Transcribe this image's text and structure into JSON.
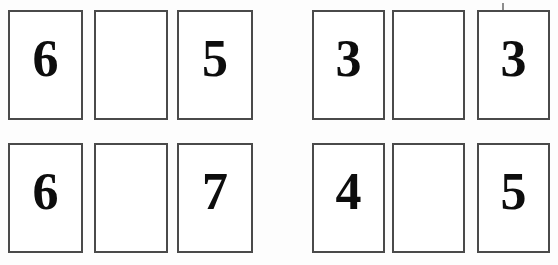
{
  "canvas": {
    "width": 558,
    "height": 265,
    "background_color": "#fdfdfd"
  },
  "style": {
    "card_fill": "#ffffff",
    "card_border_color": "#4a4a4a",
    "card_border_width_px": 2,
    "digit_color": "#0d0d0d",
    "tick_color": "#8d8d8d"
  },
  "groups": [
    {
      "name": "top-left-group",
      "position": "top-left",
      "cards": [
        {
          "value": "6",
          "empty": false,
          "x": 8,
          "y": 10,
          "w": 75,
          "h": 110
        },
        {
          "value": "",
          "empty": true,
          "x": 94,
          "y": 10,
          "w": 74,
          "h": 110
        },
        {
          "value": "5",
          "empty": false,
          "x": 177,
          "y": 10,
          "w": 76,
          "h": 110
        }
      ]
    },
    {
      "name": "top-right-group",
      "position": "top-right",
      "cards": [
        {
          "value": "3",
          "empty": false,
          "x": 312,
          "y": 10,
          "w": 73,
          "h": 110
        },
        {
          "value": "",
          "empty": true,
          "x": 392,
          "y": 10,
          "w": 73,
          "h": 110
        },
        {
          "value": "3",
          "empty": false,
          "x": 477,
          "y": 10,
          "w": 73,
          "h": 110
        }
      ]
    },
    {
      "name": "bottom-left-group",
      "position": "bottom-left",
      "cards": [
        {
          "value": "6",
          "empty": false,
          "x": 8,
          "y": 143,
          "w": 75,
          "h": 110
        },
        {
          "value": "",
          "empty": true,
          "x": 94,
          "y": 143,
          "w": 74,
          "h": 110
        },
        {
          "value": "7",
          "empty": false,
          "x": 177,
          "y": 143,
          "w": 76,
          "h": 110
        }
      ]
    },
    {
      "name": "bottom-right-group",
      "position": "bottom-right",
      "cards": [
        {
          "value": "4",
          "empty": false,
          "x": 312,
          "y": 143,
          "w": 73,
          "h": 110
        },
        {
          "value": "",
          "empty": true,
          "x": 392,
          "y": 143,
          "w": 73,
          "h": 110
        },
        {
          "value": "5",
          "empty": false,
          "x": 477,
          "y": 143,
          "w": 73,
          "h": 110
        }
      ]
    }
  ],
  "marks": [
    {
      "name": "tick-mark-above-top-right-card",
      "x": 502,
      "y": 3
    }
  ]
}
